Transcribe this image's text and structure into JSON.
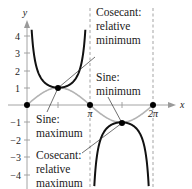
{
  "chart_data": {
    "type": "line",
    "title": "",
    "xlabel": "x",
    "ylabel": "y",
    "xlim": [
      0,
      7.0
    ],
    "ylim": [
      -4.4,
      4.6
    ],
    "x_ticks": [
      {
        "value": 3.14159,
        "label": "π"
      },
      {
        "value": 6.28319,
        "label": "2π"
      }
    ],
    "x_minor_ticks": [
      1.5708,
      4.7124
    ],
    "y_ticks": [
      {
        "value": 4,
        "label": "4"
      },
      {
        "value": 3,
        "label": "3"
      },
      {
        "value": 2,
        "label": "2"
      },
      {
        "value": 1,
        "label": "1"
      },
      {
        "value": -1,
        "label": "−1"
      },
      {
        "value": -2,
        "label": "−2"
      },
      {
        "value": -3,
        "label": "−3"
      },
      {
        "value": -4,
        "label": "−4"
      }
    ],
    "grid": false,
    "series": [
      {
        "name": "y = sin x",
        "style": "gray",
        "x_range": [
          0,
          6.28319
        ]
      },
      {
        "name": "y = csc x",
        "style": "black",
        "x_range": [
          0.22,
          6.06
        ]
      }
    ],
    "asymptotes": [
      3.14159,
      6.28319
    ],
    "points": [
      {
        "x": 0,
        "y": 0
      },
      {
        "x": 1.5708,
        "y": 1
      },
      {
        "x": 3.14159,
        "y": 0
      },
      {
        "x": 4.7124,
        "y": -1
      },
      {
        "x": 6.28319,
        "y": 0
      }
    ],
    "annotations": [
      {
        "lines": [
          "Cosecant:",
          "relative",
          "minimum"
        ],
        "target": [
          1.5708,
          1
        ]
      },
      {
        "lines": [
          "Sine:",
          "minimum"
        ],
        "target": [
          4.7124,
          -1
        ]
      },
      {
        "lines": [
          "Sine:",
          "maximum"
        ],
        "target": [
          1.5708,
          1
        ]
      },
      {
        "lines": [
          "Cosecant:",
          "relative",
          "maximum"
        ],
        "target": [
          4.7124,
          -1
        ]
      }
    ]
  },
  "labels": {
    "y_axis": "y",
    "x_axis": "x",
    "pi": "π",
    "two_pi": "2π",
    "y4": "4",
    "y3": "3",
    "y2": "2",
    "y1": "1",
    "ym1": "−1",
    "ym2": "−2",
    "ym3": "−3",
    "ym4": "−4",
    "csc_min_1": "Cosecant:",
    "csc_min_2": "relative",
    "csc_min_3": "minimum",
    "sine_min_1": "Sine:",
    "sine_min_2": "minimum",
    "sine_max_1": "Sine:",
    "sine_max_2": "maximum",
    "csc_max_1": "Cosecant:",
    "csc_max_2": "relative",
    "csc_max_3": "maximum"
  },
  "colors": {
    "sine": "#b3b3b3",
    "cosecant": "#111111",
    "axis": "#9a9a9a",
    "asymptote": "#999999",
    "point": "#000000",
    "text": "#222222"
  }
}
